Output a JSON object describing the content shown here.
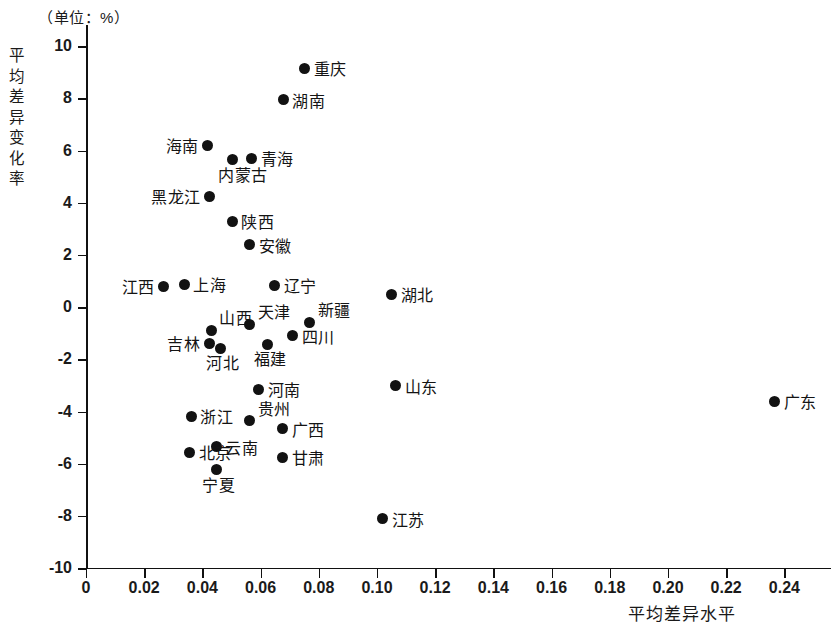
{
  "chart_data": {
    "type": "scatter",
    "title": "",
    "unit_note": "（单位：%）",
    "xlabel": "平均差异水平",
    "ylabel": "平均差异变化率",
    "xlim": [
      0,
      0.25
    ],
    "ylim": [
      -10,
      10
    ],
    "xticks": [
      "0",
      "0.02",
      "0.04",
      "0.06",
      "0.08",
      "0.10",
      "0.12",
      "0.14",
      "0.16",
      "0.18",
      "0.20",
      "0.22",
      "0.24"
    ],
    "xtick_values": [
      0,
      0.02,
      0.04,
      0.06,
      0.08,
      0.1,
      0.12,
      0.14,
      0.16,
      0.18,
      0.2,
      0.22,
      0.24
    ],
    "yticks": [
      "10",
      "8",
      "6",
      "4",
      "2",
      "0",
      "-2",
      "-4",
      "-6",
      "-8",
      "-10"
    ],
    "ytick_values": [
      10,
      8,
      6,
      4,
      2,
      0,
      -2,
      -4,
      -6,
      -8,
      -10
    ],
    "grid": false,
    "legend": "none",
    "marker_color": "#121212",
    "points": [
      {
        "label": "重庆",
        "x": 0.0752,
        "y": 9.15,
        "label_side": "right"
      },
      {
        "label": "湖南",
        "x": 0.0677,
        "y": 7.95,
        "label_side": "right"
      },
      {
        "label": "海南",
        "x": 0.0419,
        "y": 6.2,
        "label_side": "left"
      },
      {
        "label": "青海",
        "x": 0.057,
        "y": 5.7,
        "label_side": "right"
      },
      {
        "label": "内蒙古",
        "x": 0.0502,
        "y": 5.65,
        "label_side": "below"
      },
      {
        "label": "黑龙江",
        "x": 0.0426,
        "y": 4.25,
        "label_side": "left"
      },
      {
        "label": "陕西",
        "x": 0.0502,
        "y": 3.3,
        "label_side": "right"
      },
      {
        "label": "安徽",
        "x": 0.0563,
        "y": 2.4,
        "label_side": "right"
      },
      {
        "label": "江西",
        "x": 0.0268,
        "y": 0.8,
        "label_side": "left"
      },
      {
        "label": "上海",
        "x": 0.0337,
        "y": 0.88,
        "label_side": "right"
      },
      {
        "label": "辽宁",
        "x": 0.0649,
        "y": 0.85,
        "label_side": "right"
      },
      {
        "label": "湖北",
        "x": 0.1051,
        "y": 0.5,
        "label_side": "right"
      },
      {
        "label": "山西",
        "x": 0.043,
        "y": -0.88,
        "label_side": "above"
      },
      {
        "label": "天津",
        "x": 0.0563,
        "y": -0.65,
        "label_side": "above"
      },
      {
        "label": "新疆",
        "x": 0.0769,
        "y": -0.58,
        "label_side": "above"
      },
      {
        "label": "四川",
        "x": 0.0711,
        "y": -1.1,
        "label_side": "right"
      },
      {
        "label": "吉林",
        "x": 0.0423,
        "y": -1.38,
        "label_side": "left"
      },
      {
        "label": "河北",
        "x": 0.0461,
        "y": -1.57,
        "label_side": "below"
      },
      {
        "label": "福建",
        "x": 0.0625,
        "y": -1.42,
        "label_side": "below"
      },
      {
        "label": "河南",
        "x": 0.0594,
        "y": -3.15,
        "label_side": "right"
      },
      {
        "label": "山东",
        "x": 0.1065,
        "y": -3.0,
        "label_side": "right"
      },
      {
        "label": "广东",
        "x": 0.2367,
        "y": -3.6,
        "label_side": "right"
      },
      {
        "label": "浙江",
        "x": 0.0361,
        "y": -4.18,
        "label_side": "right"
      },
      {
        "label": "贵州",
        "x": 0.0563,
        "y": -4.35,
        "label_side": "above"
      },
      {
        "label": "广西",
        "x": 0.0676,
        "y": -4.65,
        "label_side": "right"
      },
      {
        "label": "云南",
        "x": 0.0447,
        "y": -5.35,
        "label_side": "right"
      },
      {
        "label": "北京",
        "x": 0.0357,
        "y": -5.55,
        "label_side": "right"
      },
      {
        "label": "甘肃",
        "x": 0.0676,
        "y": -5.75,
        "label_side": "right"
      },
      {
        "label": "宁夏",
        "x": 0.0447,
        "y": -6.23,
        "label_side": "below"
      },
      {
        "label": "江苏",
        "x": 0.102,
        "y": -8.1,
        "label_side": "right"
      }
    ]
  },
  "axes": {
    "unit_note": "（单位：%）",
    "x_title": "平均差异水平",
    "y_title": "平均差异变化率"
  }
}
